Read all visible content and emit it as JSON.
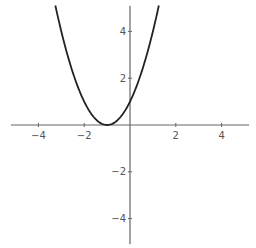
{
  "chart_data": {
    "type": "line",
    "title": "",
    "xlabel": "",
    "ylabel": "",
    "function": "y = (x + 1)^2",
    "xlim": [
      -5.2,
      5.2
    ],
    "ylim": [
      -5.1,
      5.1
    ],
    "grid": false,
    "legend": null,
    "x_ticks": [
      -4,
      -2,
      2,
      4
    ],
    "y_ticks": [
      -4,
      -2,
      2,
      4
    ],
    "x_tick_labels": [
      "-4",
      "-2",
      "2",
      "4"
    ],
    "y_tick_labels": [
      "-4",
      "-2",
      "2",
      "4"
    ],
    "series": [
      {
        "name": "(x+1)^2",
        "color": "#222222",
        "x": [
          -3.26,
          -3.0,
          -2.5,
          -2.0,
          -1.5,
          -1.0,
          -0.5,
          0.0,
          0.5,
          1.0,
          1.26
        ],
        "y": [
          5.1,
          4.0,
          2.25,
          1.0,
          0.25,
          0.0,
          0.25,
          1.0,
          2.25,
          4.0,
          5.1
        ]
      }
    ],
    "axis_color": "#666666"
  }
}
